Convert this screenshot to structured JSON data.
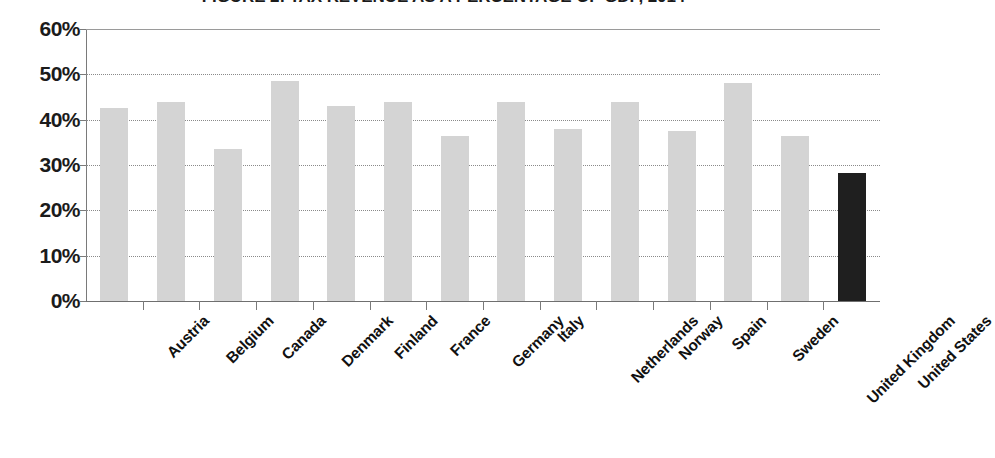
{
  "chart_data": {
    "type": "bar",
    "title": "FIGURE 2: TAX REVENUE AS A PERCENTAGE OF GDP, 2014",
    "xlabel": "",
    "ylabel": "",
    "ylim": [
      0,
      60
    ],
    "ytick_labels": [
      "60%",
      "50%",
      "40%",
      "30%",
      "20%",
      "10%",
      "0%"
    ],
    "ytick_values": [
      60,
      50,
      40,
      30,
      20,
      10,
      0
    ],
    "grid": true,
    "legend": "none",
    "value_suffix": "%",
    "categories": [
      "Austria",
      "Belgium",
      "Canada",
      "Denmark",
      "Finland",
      "France",
      "Germany",
      "Italy",
      "Netherlands",
      "Norway",
      "Spain",
      "Sweden",
      "United Kingdom",
      "United States"
    ],
    "values": [
      42.5,
      44.0,
      33.5,
      48.5,
      43.0,
      44.0,
      36.4,
      44.0,
      38.0,
      44.0,
      37.5,
      48.2,
      36.4,
      28.2
    ],
    "bar_colors": [
      "#d4d4d4",
      "#d4d4d4",
      "#d4d4d4",
      "#d4d4d4",
      "#d4d4d4",
      "#d4d4d4",
      "#d4d4d4",
      "#d4d4d4",
      "#d4d4d4",
      "#d4d4d4",
      "#d4d4d4",
      "#d4d4d4",
      "#d4d4d4",
      "#1f1f1f"
    ],
    "highlighted_category": "United States",
    "colors": {
      "bar_default": "#d4d4d4",
      "bar_highlight": "#1f1f1f",
      "gridline": "#8a8a8a",
      "axis": "#6f6f6f",
      "text": "#1b1b1b"
    }
  }
}
